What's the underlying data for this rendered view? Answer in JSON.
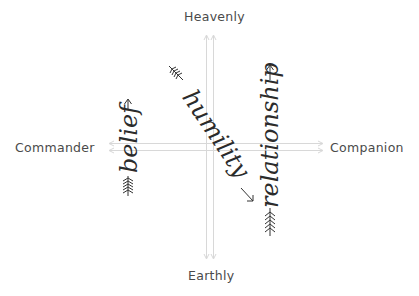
{
  "axes": {
    "top_label": "Heavenly",
    "bottom_label": "Earthly",
    "left_label": "Commander",
    "right_label": "Companion",
    "line_color": "#d6d6d6"
  },
  "arrows": [
    {
      "word": "belief",
      "orientation": "vertical-up",
      "angle_deg": -90
    },
    {
      "word": "humility",
      "orientation": "diagonal-down-right",
      "angle_deg": 58
    },
    {
      "word": "relationship",
      "orientation": "vertical-up",
      "angle_deg": -90
    }
  ],
  "colors": {
    "text": "#2b2b2b",
    "label": "#4a4a4a",
    "background": "#ffffff"
  }
}
